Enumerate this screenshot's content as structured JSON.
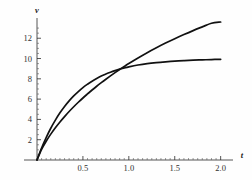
{
  "chart_data": {
    "type": "line",
    "title": "",
    "xlabel": "t",
    "ylabel": "v",
    "xlim": [
      0,
      2.08
    ],
    "ylim": [
      0,
      13.6
    ],
    "grid": false,
    "legend": "none",
    "xticks": [
      0.5,
      1.0,
      1.5,
      2.0
    ],
    "xtick_labels": [
      "0.5",
      "1.0",
      "1.5",
      "2.0"
    ],
    "yticks": [
      2,
      4,
      6,
      8,
      10,
      12
    ],
    "ytick_labels": [
      "2",
      "4",
      "6",
      "8",
      "10",
      "12"
    ],
    "x": [
      0,
      0.05,
      0.1,
      0.15,
      0.2,
      0.25,
      0.3,
      0.35,
      0.4,
      0.45,
      0.5,
      0.55,
      0.6,
      0.65,
      0.7,
      0.75,
      0.8,
      0.85,
      0.9,
      0.95,
      1.0,
      1.1,
      1.2,
      1.3,
      1.4,
      1.5,
      1.6,
      1.7,
      1.8,
      1.9,
      2.0
    ],
    "series": [
      {
        "name": "upper-curve",
        "color": "#111111",
        "values": [
          0,
          1.05,
          1.85,
          2.55,
          3.18,
          3.75,
          4.28,
          4.78,
          5.25,
          5.69,
          6.11,
          6.51,
          6.9,
          7.27,
          7.62,
          7.96,
          8.29,
          8.61,
          8.92,
          9.22,
          9.51,
          10.06,
          10.58,
          11.06,
          11.52,
          11.95,
          12.36,
          12.75,
          13.12,
          13.48,
          13.6
        ]
      },
      {
        "name": "lower-curve",
        "color": "#111111",
        "values": [
          0,
          1.18,
          2.21,
          3.13,
          3.93,
          4.65,
          5.28,
          5.83,
          6.32,
          6.75,
          7.14,
          7.47,
          7.77,
          8.03,
          8.27,
          8.47,
          8.65,
          8.81,
          8.95,
          9.07,
          9.18,
          9.36,
          9.5,
          9.6,
          9.68,
          9.75,
          9.8,
          9.84,
          9.87,
          9.9,
          9.92
        ]
      }
    ],
    "crossing_point": {
      "t": 0.72,
      "v": 7.7
    },
    "annotations": []
  },
  "axis": {
    "y_label": "v",
    "x_label": "t"
  }
}
